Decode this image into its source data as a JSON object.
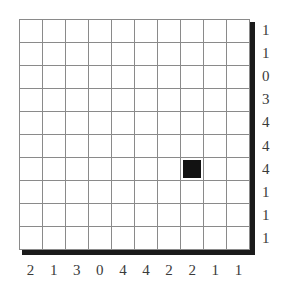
{
  "puzzle": {
    "type": "grid-puzzle",
    "grid": {
      "columns": 10,
      "rows": 10,
      "line_color": "#8a8a8a",
      "fill_color": "#121212",
      "background_color": "#ffffff",
      "shadow_color": "#1b1b1b",
      "filled_cells": [
        {
          "row": 7,
          "col": 8
        }
      ],
      "cells": [
        [
          0,
          0,
          0,
          0,
          0,
          0,
          0,
          0,
          0,
          0
        ],
        [
          0,
          0,
          0,
          0,
          0,
          0,
          0,
          0,
          0,
          0
        ],
        [
          0,
          0,
          0,
          0,
          0,
          0,
          0,
          0,
          0,
          0
        ],
        [
          0,
          0,
          0,
          0,
          0,
          0,
          0,
          0,
          0,
          0
        ],
        [
          0,
          0,
          0,
          0,
          0,
          0,
          0,
          0,
          0,
          0
        ],
        [
          0,
          0,
          0,
          0,
          0,
          0,
          0,
          0,
          0,
          0
        ],
        [
          0,
          0,
          0,
          0,
          0,
          0,
          0,
          1,
          0,
          0
        ],
        [
          0,
          0,
          0,
          0,
          0,
          0,
          0,
          0,
          0,
          0
        ],
        [
          0,
          0,
          0,
          0,
          0,
          0,
          0,
          0,
          0,
          0
        ],
        [
          0,
          0,
          0,
          0,
          0,
          0,
          0,
          0,
          0,
          0
        ]
      ]
    },
    "row_clues": [
      "1",
      "1",
      "0",
      "3",
      "4",
      "4",
      "4",
      "1",
      "1",
      "1"
    ],
    "column_clues": [
      "2",
      "1",
      "3",
      "0",
      "4",
      "4",
      "2",
      "2",
      "1",
      "1"
    ]
  }
}
